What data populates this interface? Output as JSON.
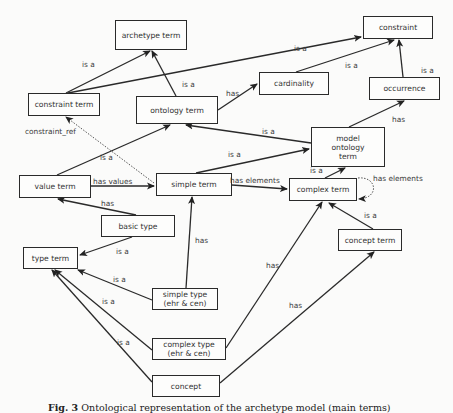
{
  "figure": {
    "caption_label": "Fig. 3",
    "caption_text": "Ontological representation of the archetype model (main terms)"
  },
  "nodes": {
    "archetype_term": {
      "label": "archetype term",
      "x": 115,
      "y": 20,
      "w": 72,
      "h": 30
    },
    "constraint": {
      "label": "constraint",
      "x": 363,
      "y": 16,
      "w": 70,
      "h": 23
    },
    "constraint_term": {
      "label": "constraint term",
      "x": 28,
      "y": 93,
      "w": 72,
      "h": 23
    },
    "ontology_term": {
      "label": "ontology term",
      "x": 136,
      "y": 96,
      "w": 82,
      "h": 28
    },
    "cardinality": {
      "label": "cardinality",
      "x": 259,
      "y": 72,
      "w": 70,
      "h": 23
    },
    "occurrence": {
      "label": "occurrence",
      "x": 369,
      "y": 77,
      "w": 71,
      "h": 23
    },
    "model_ontology_term": {
      "label": "model\nontology\nterm",
      "x": 311,
      "y": 127,
      "w": 74,
      "h": 40
    },
    "value_term": {
      "label": "value term",
      "x": 19,
      "y": 175,
      "w": 72,
      "h": 23
    },
    "simple_term": {
      "label": "simple term",
      "x": 156,
      "y": 173,
      "w": 76,
      "h": 23
    },
    "complex_term": {
      "label": "complex term",
      "x": 289,
      "y": 178,
      "w": 68,
      "h": 23
    },
    "basic_type": {
      "label": "basic type",
      "x": 101,
      "y": 215,
      "w": 74,
      "h": 22
    },
    "concept_term": {
      "label": "concept term",
      "x": 338,
      "y": 229,
      "w": 64,
      "h": 22
    },
    "type_term": {
      "label": "type term",
      "x": 23,
      "y": 247,
      "w": 55,
      "h": 22
    },
    "simple_type": {
      "label": "simple type\n(ehr & cen)",
      "x": 152,
      "y": 288,
      "w": 66,
      "h": 22
    },
    "complex_type": {
      "label": "complex type\n(ehr & cen)",
      "x": 152,
      "y": 338,
      "w": 74,
      "h": 22
    },
    "concept": {
      "label": "concept",
      "x": 152,
      "y": 375,
      "w": 68,
      "h": 22
    }
  },
  "edges": [
    {
      "from": "constraint_term",
      "to": "archetype_term",
      "label": "is a",
      "lx": 82,
      "ly": 60,
      "style": "solid",
      "path": "M66 93 L150 51"
    },
    {
      "from": "constraint_term",
      "to": "constraint",
      "label": "is a",
      "lx": 294,
      "ly": 44,
      "style": "solid",
      "path": "M68 93 L361 37"
    },
    {
      "from": "ontology_term",
      "to": "archetype_term",
      "label": "is a",
      "lx": 182,
      "ly": 80,
      "style": "solid",
      "path": "M176 96 L152 51"
    },
    {
      "from": "ontology_term",
      "to": "cardinality",
      "label": "has",
      "lx": 226,
      "ly": 89,
      "style": "solid",
      "path": "M218 110 L257 84"
    },
    {
      "from": "cardinality",
      "to": "constraint",
      "label": "is a",
      "lx": 345,
      "ly": 61,
      "style": "solid",
      "path": "M296 72 L394 40"
    },
    {
      "from": "occurrence",
      "to": "constraint",
      "label": "is a",
      "lx": 421,
      "ly": 66,
      "style": "solid",
      "path": "M403 77 L399 40"
    },
    {
      "from": "model_ontology_term",
      "to": "occurrence",
      "label": "has",
      "lx": 392,
      "ly": 115,
      "style": "solid",
      "path": "M349 127 L404 101"
    },
    {
      "from": "model_ontology_term",
      "to": "ontology_term",
      "label": "is a",
      "lx": 262,
      "ly": 127,
      "style": "solid",
      "path": "M311 143 L186 125"
    },
    {
      "from": "simple_term",
      "to": "model_ontology_term",
      "label": "is a",
      "lx": 228,
      "ly": 150,
      "style": "solid",
      "path": "M196 173 L309 149"
    },
    {
      "from": "complex_term",
      "to": "model_ontology_term",
      "label": "is a",
      "lx": 310,
      "ly": 166,
      "style": "solid",
      "path": "M325 178 L345 168"
    },
    {
      "from": "value_term",
      "to": "ontology_term",
      "label": "is a",
      "lx": 100,
      "ly": 153,
      "style": "solid",
      "path": "M57 175 L170 125"
    },
    {
      "from": "simple_term",
      "to": "constraint_term",
      "label": "constraint_ref",
      "lx": 25,
      "ly": 127,
      "style": "dotted",
      "path": "M154 183 L66 117"
    },
    {
      "from": "value_term",
      "to": "simple_term",
      "label": "has values",
      "lx": 93,
      "ly": 177,
      "style": "solid",
      "path": "M91 186 L154 186"
    },
    {
      "from": "simple_term",
      "to": "complex_term",
      "label": "has elements",
      "lx": 230,
      "ly": 176,
      "style": "solid",
      "path": "M232 185 L287 189"
    },
    {
      "from": "complex_term",
      "to": "complex_term",
      "label": "has  elements",
      "lx": 373,
      "ly": 174,
      "style": "dotted",
      "path": "M358 178 C377 176 380 198 359 199"
    },
    {
      "from": "basic_type",
      "to": "value_term",
      "label": "has",
      "lx": 101,
      "ly": 199,
      "style": "solid",
      "path": "M136 215 L58 199"
    },
    {
      "from": "concept_term",
      "to": "complex_term",
      "label": "is a",
      "lx": 364,
      "ly": 211,
      "style": "solid",
      "path": "M373 229 L329 203"
    },
    {
      "from": "basic_type",
      "to": "type_term",
      "label": "is a",
      "lx": 116,
      "ly": 247,
      "style": "solid",
      "path": "M132 237 L80 255"
    },
    {
      "from": "simple_type",
      "to": "simple_term",
      "label": "has",
      "lx": 195,
      "ly": 236,
      "style": "solid",
      "path": "M186 288 L192 197"
    },
    {
      "from": "simple_type",
      "to": "type_term",
      "label": "is a",
      "lx": 113,
      "ly": 275,
      "style": "solid",
      "path": "M152 300 L78 270"
    },
    {
      "from": "complex_type",
      "to": "type_term",
      "label": "is a",
      "lx": 102,
      "ly": 297,
      "style": "solid",
      "path": "M152 350 L55 270"
    },
    {
      "from": "complex_type",
      "to": "complex_term",
      "label": "has",
      "lx": 266,
      "ly": 261,
      "style": "solid",
      "path": "M226 348 L322 202"
    },
    {
      "from": "concept",
      "to": "type_term",
      "label": "is a",
      "lx": 117,
      "ly": 338,
      "style": "solid",
      "path": "M152 382 L52 270"
    },
    {
      "from": "concept",
      "to": "concept_term",
      "label": "has",
      "lx": 289,
      "ly": 301,
      "style": "solid",
      "path": "M220 383 L374 252"
    }
  ]
}
